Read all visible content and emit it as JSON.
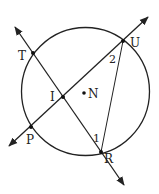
{
  "diagram": {
    "type": "circle-geometry",
    "colors": {
      "stroke": "#222222",
      "background": "#ffffff"
    },
    "circle": {
      "center_label": "N",
      "cx": 85.5,
      "cy": 91.5,
      "r": 64
    },
    "points": [
      {
        "label": "T",
        "x": 33,
        "y": 53
      },
      {
        "label": "U",
        "x": 123,
        "y": 41
      },
      {
        "label": "P",
        "x": 31,
        "y": 127
      },
      {
        "label": "R",
        "x": 101,
        "y": 152
      },
      {
        "label": "I",
        "x": 63,
        "y": 97
      },
      {
        "label": "N",
        "x": 84,
        "y": 93
      }
    ],
    "lines": [
      {
        "name": "line-TR",
        "through": [
          "T",
          "I",
          "R"
        ],
        "arrows": "both"
      },
      {
        "name": "line-PU",
        "through": [
          "P",
          "I",
          "U"
        ],
        "arrows": "both"
      }
    ],
    "segments": [
      {
        "name": "segment-UR",
        "from": "U",
        "to": "R"
      }
    ],
    "angle_labels": [
      {
        "label": "1",
        "vertex": "R"
      },
      {
        "label": "2",
        "vertex": "U"
      }
    ]
  }
}
